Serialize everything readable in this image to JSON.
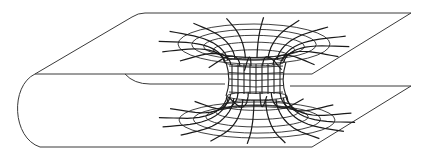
{
  "figure": {
    "title": "Wormhole connecting two regions of a folded space sheet",
    "width": 424,
    "height": 156,
    "stroke_color": "#222222",
    "background": "#ffffff"
  },
  "sheet": {
    "top_plane": {
      "back_left": [
        145,
        13
      ],
      "back_right": [
        411,
        13
      ],
      "front_right": [
        312,
        74
      ],
      "front_left": [
        35,
        74
      ]
    },
    "bottom_plane": {
      "back_left": [
        150,
        86
      ],
      "back_right": [
        411,
        86
      ],
      "front_right": [
        312,
        147
      ],
      "front_left": [
        40,
        147
      ]
    },
    "fold": {
      "outer_leftmost_x": 14,
      "inner_fold_start": [
        125,
        74
      ],
      "inner_fold_end": [
        150,
        84
      ]
    }
  },
  "wormhole": {
    "top_mouth": {
      "cx": 254,
      "cy": 44,
      "rx_outer": 76,
      "ry_outer": 20,
      "rings": 5
    },
    "bottom_mouth": {
      "cx": 257,
      "cy": 120,
      "rx_outer": 78,
      "ry_outer": 18,
      "rings": 5
    },
    "throat": {
      "cx": 256,
      "top_y": 62,
      "bottom_y": 96,
      "rx": 30,
      "ry": 4
    },
    "radial_lines": 16
  }
}
